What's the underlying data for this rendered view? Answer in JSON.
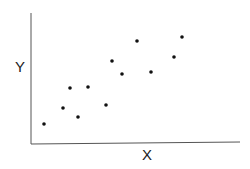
{
  "chart_data": {
    "type": "scatter",
    "title": "",
    "xlabel": "X",
    "ylabel": "Y",
    "grid": false,
    "legend": null,
    "x_ticks": [],
    "y_ticks": [],
    "points": [
      {
        "x": 13,
        "y": 20
      },
      {
        "x": 32,
        "y": 36
      },
      {
        "x": 39,
        "y": 56
      },
      {
        "x": 47,
        "y": 27
      },
      {
        "x": 57,
        "y": 57
      },
      {
        "x": 75,
        "y": 39
      },
      {
        "x": 81,
        "y": 83
      },
      {
        "x": 91,
        "y": 70
      },
      {
        "x": 106,
        "y": 103
      },
      {
        "x": 120,
        "y": 72
      },
      {
        "x": 143,
        "y": 87
      },
      {
        "x": 151,
        "y": 107
      }
    ],
    "note": "Values in arbitrary pixel-relative units; axes have no tick labels",
    "marker_color": "#111111"
  }
}
